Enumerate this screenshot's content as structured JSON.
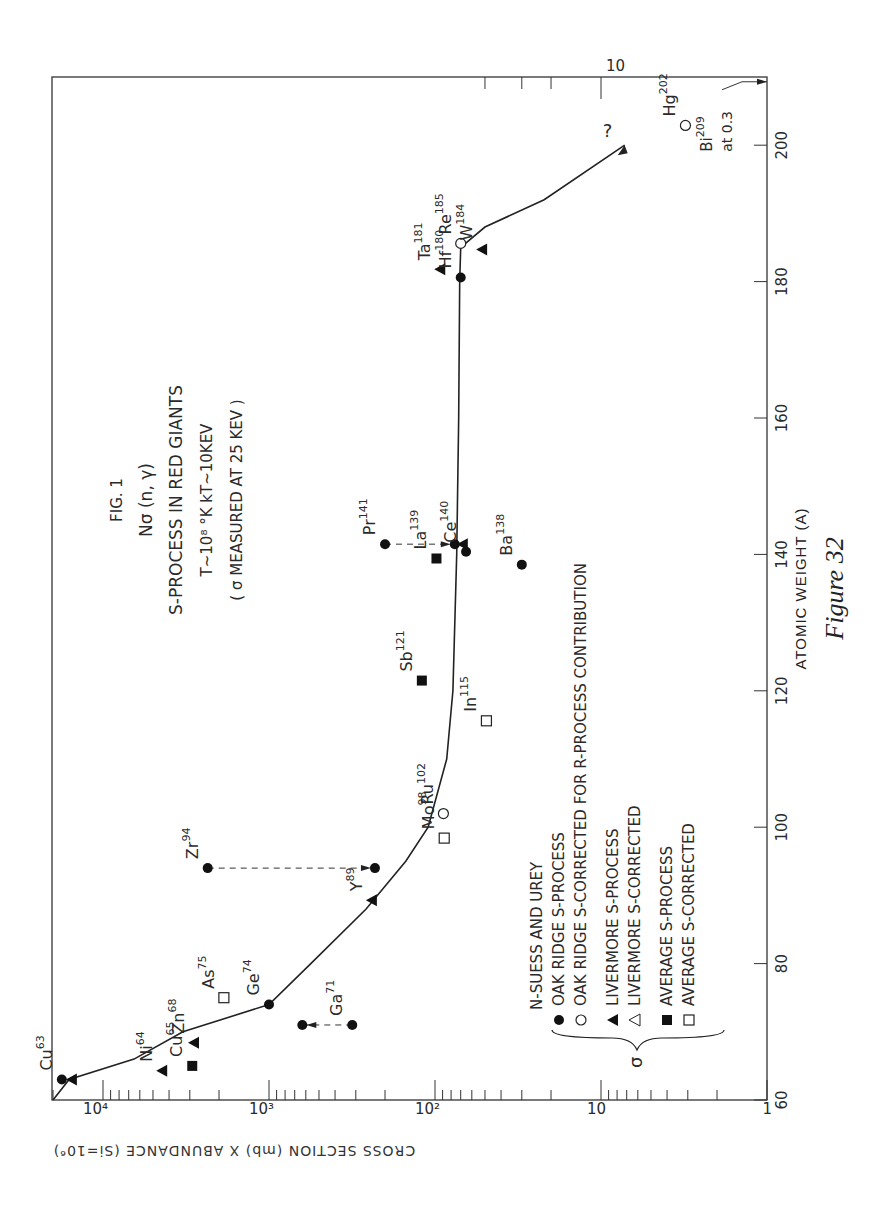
{
  "chart_data": {
    "type": "scatter",
    "title": "FIG. 1",
    "title_lines": [
      "FIG. 1",
      "Nσ (n, γ)",
      "S-PROCESS IN RED GIANTS",
      "T~10⁸ °K     kT~10KEV",
      "( σ MEASURED AT 25 KEV )"
    ],
    "figure_caption": "Figure 32",
    "xlabel": "ATOMIC WEIGHT (A)",
    "ylabel": "CROSS SECTION (mb) X ABUNDANCE (Si=10⁶)",
    "xlim": [
      60,
      210
    ],
    "ylim": [
      1,
      20000
    ],
    "yscale": "log",
    "x_ticks": [
      60,
      80,
      100,
      120,
      140,
      160,
      180,
      200
    ],
    "y_ticks": [
      {
        "value": 1,
        "label": "1"
      },
      {
        "value": 10,
        "label": "10"
      },
      {
        "value": 100,
        "label": "10²"
      },
      {
        "value": 1000,
        "label": "10³"
      },
      {
        "value": 10000,
        "label": "10⁴"
      }
    ],
    "grid": false,
    "legend": {
      "position": "lower-center",
      "header": "N-SUESS AND UREY",
      "bracket_symbol": "σ",
      "entries": [
        {
          "marker": "filled-circle",
          "label": "OAK RIDGE   S-PROCESS"
        },
        {
          "marker": "open-circle",
          "label": "OAK RIDGE   S-CORRECTED FOR R-PROCESS CONTRIBUTION"
        },
        {
          "marker": "filled-triangle",
          "label": "LIVERMORE  S-PROCESS"
        },
        {
          "marker": "open-triangle",
          "label": "LIVERMORE  S-CORRECTED"
        },
        {
          "marker": "filled-square",
          "label": "AVERAGE       S-PROCESS"
        },
        {
          "marker": "open-square",
          "label": "AVERAGE       S-CORRECTED"
        }
      ]
    },
    "points": [
      {
        "label": "Cu",
        "mass": "63",
        "A": 63,
        "value": 17700,
        "marker": "filled-circle"
      },
      {
        "label": "",
        "mass": "",
        "A": 63,
        "value": 15400,
        "marker": "filled-triangle"
      },
      {
        "label": "Ni",
        "mass": "64",
        "A": 64.3,
        "value": 4400,
        "marker": "filled-triangle"
      },
      {
        "label": "Cu",
        "mass": "65",
        "A": 65,
        "value": 2900,
        "marker": "filled-square"
      },
      {
        "label": "Zn",
        "mass": "68",
        "A": 68.4,
        "value": 2830,
        "marker": "filled-triangle"
      },
      {
        "label": "Ga",
        "mass": "71",
        "A": 71,
        "value": 315,
        "marker": "filled-circle"
      },
      {
        "label": "",
        "mass": "",
        "A": 71,
        "value": 630,
        "marker": "filled-circle"
      },
      {
        "label": "Ge",
        "mass": "74",
        "A": 74,
        "value": 1000,
        "marker": "filled-circle"
      },
      {
        "label": "As",
        "mass": "75",
        "A": 75,
        "value": 1870,
        "marker": "open-square"
      },
      {
        "label": "Y",
        "mass": "89",
        "A": 89.3,
        "value": 240,
        "marker": "filled-triangle"
      },
      {
        "label": "Zr",
        "mass": "94",
        "A": 94,
        "value": 2340,
        "marker": "filled-circle"
      },
      {
        "label": "",
        "mass": "",
        "A": 94,
        "value": 230,
        "marker": "filled-circle"
      },
      {
        "label": "Mo",
        "mass": "98",
        "A": 98.4,
        "value": 88,
        "marker": "open-square"
      },
      {
        "label": "Ru",
        "mass": "102",
        "A": 102,
        "value": 89,
        "marker": "open-circle"
      },
      {
        "label": "In",
        "mass": "115",
        "A": 115.6,
        "value": 49,
        "marker": "open-square"
      },
      {
        "label": "Sb",
        "mass": "121",
        "A": 121.5,
        "value": 120,
        "marker": "filled-square"
      },
      {
        "label": "Ba",
        "mass": "138",
        "A": 138.5,
        "value": 30,
        "marker": "filled-circle"
      },
      {
        "label": "La",
        "mass": "139",
        "A": 139.4,
        "value": 98,
        "marker": "filled-square"
      },
      {
        "label": "Ce",
        "mass": "140",
        "A": 140.4,
        "value": 65,
        "marker": "filled-circle"
      },
      {
        "label": "Pr",
        "mass": "141",
        "A": 141.5,
        "value": 200,
        "marker": "filled-circle"
      },
      {
        "label": "",
        "mass": "",
        "A": 141.5,
        "value": 76,
        "marker": "filled-circle"
      },
      {
        "label": "",
        "mass": "",
        "A": 141.5,
        "value": 68,
        "marker": "filled-triangle"
      },
      {
        "label": "Hf",
        "mass": "180",
        "A": 180.6,
        "value": 70,
        "marker": "filled-circle"
      },
      {
        "label": "Ta",
        "mass": "181",
        "A": 181.8,
        "value": 93,
        "marker": "filled-triangle"
      },
      {
        "label": "W",
        "mass": "184",
        "A": 184.7,
        "value": 52,
        "marker": "filled-triangle"
      },
      {
        "label": "Re",
        "mass": "185",
        "A": 185.6,
        "value": 70,
        "marker": "open-circle"
      },
      {
        "label": "Hg",
        "mass": "202",
        "A": 202.9,
        "value": 3.1,
        "marker": "open-circle"
      }
    ],
    "dashed_corrections": [
      {
        "element": "Ga71",
        "A": 71,
        "from": 315,
        "to": 630
      },
      {
        "element": "Zr94",
        "A": 94,
        "from": 2340,
        "to": 230
      },
      {
        "element": "Pr141",
        "A": 141.5,
        "from": 200,
        "to": 76
      }
    ],
    "curve": {
      "name": "Nσ s-process fit",
      "points": [
        [
          60,
          20000
        ],
        [
          63,
          16000
        ],
        [
          66,
          6500
        ],
        [
          70,
          3300
        ],
        [
          74,
          1000
        ],
        [
          80,
          560
        ],
        [
          88,
          260
        ],
        [
          95,
          150
        ],
        [
          100,
          110
        ],
        [
          110,
          85
        ],
        [
          120,
          78
        ],
        [
          140,
          74
        ],
        [
          160,
          72
        ],
        [
          180,
          71
        ],
        [
          185,
          70
        ],
        [
          188,
          50
        ],
        [
          192,
          22
        ],
        [
          200,
          7.2
        ]
      ],
      "end_annotation": "?"
    },
    "annotations": [
      {
        "text": "Bi²⁰⁹ at 0.3",
        "A": 209.3,
        "value": 0.3,
        "note": "arrow to axis"
      }
    ]
  }
}
